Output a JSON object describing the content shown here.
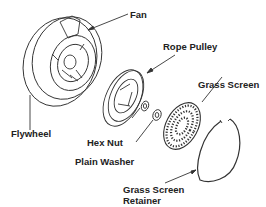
{
  "diagram": {
    "type": "exploded-parts-view",
    "labels": {
      "fan": "Fan",
      "flywheel": "Flywheel",
      "rope_pulley": "Rope Pulley",
      "grass_screen": "Grass Screen",
      "hex_nut": "Hex Nut",
      "plain_washer": "Plain Washer",
      "retainer_line1": "Grass Screen",
      "retainer_line2": "Retainer"
    }
  }
}
